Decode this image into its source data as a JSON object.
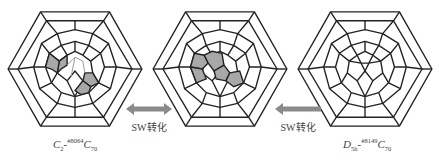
{
  "figure": {
    "molecules": [
      {
        "id": "left",
        "label_main": "C",
        "label_sub": "2",
        "label_sup": "#8064",
        "label_tail": "C",
        "label_tail_sub": "70",
        "highlighted_cells": [
          "p1",
          "h1",
          "h2",
          "p2"
        ],
        "stroke_highlight": "light"
      },
      {
        "id": "middle",
        "label_main": "",
        "label_sub": "",
        "label_sup": "",
        "label_tail": "",
        "label_tail_sub": "",
        "highlighted_cells": [
          "p1",
          "h1",
          "h2",
          "p2"
        ],
        "stroke_highlight": "none"
      },
      {
        "id": "right",
        "label_main": "D",
        "label_sub": "5h",
        "label_sup": "#8149",
        "label_tail": "C",
        "label_tail_sub": "70",
        "highlighted_cells": [],
        "stroke_highlight": "none"
      }
    ],
    "arrows": [
      {
        "label": "SW转化",
        "direction": "bidirectional"
      },
      {
        "label": "SW转化",
        "direction": "left"
      }
    ],
    "colors": {
      "stroke": "#222222",
      "highlight_fill": "#a8a8a8",
      "arrow": "#8a8a8a",
      "background": "#ffffff"
    }
  }
}
